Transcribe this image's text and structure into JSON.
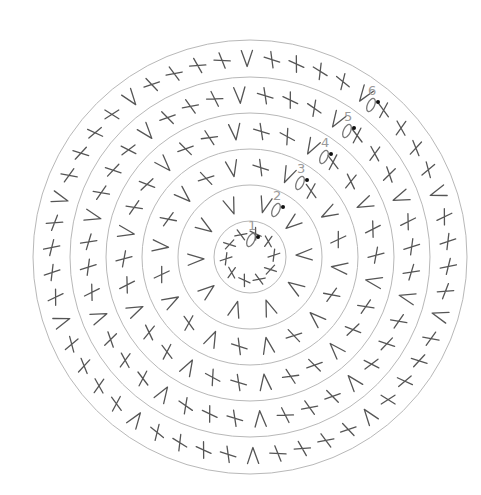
{
  "diagram": {
    "type": "crochet-round-chart",
    "center": [
      250,
      257
    ],
    "colors": {
      "ring_stroke": "#b8b8b8",
      "symbol_stroke": "#555555",
      "label": "#9a9a9a",
      "start_dot": "#111111"
    },
    "symbol_legend": {
      "X": "single-crochet-icon",
      "V": "increase-icon",
      "O": "chain-icon",
      "dot": "slip-stitch-icon"
    },
    "rings": [
      {
        "round": 1,
        "label": "1",
        "radius": 36,
        "pattern": [
          "X"
        ],
        "repeats": 10,
        "count": 10
      },
      {
        "round": 2,
        "label": "2",
        "radius": 72,
        "pattern": [
          "V"
        ],
        "repeats": 10,
        "count": 10
      },
      {
        "round": 3,
        "label": "3",
        "radius": 108,
        "pattern": [
          "X",
          "V"
        ],
        "repeats": 10,
        "count": 20
      },
      {
        "round": 4,
        "label": "4",
        "radius": 144,
        "pattern": [
          "X",
          "X",
          "V"
        ],
        "repeats": 10,
        "count": 30
      },
      {
        "round": 5,
        "label": "5",
        "radius": 180,
        "pattern": [
          "X",
          "X",
          "X",
          "V"
        ],
        "repeats": 10,
        "count": 40
      },
      {
        "round": 6,
        "label": "6",
        "radius": 217,
        "pattern": [
          "X",
          "X",
          "X",
          "X",
          "V"
        ],
        "repeats": 10,
        "count": 50
      }
    ],
    "start_markers": [
      {
        "round": "1",
        "x": 258,
        "y": 237
      },
      {
        "round": "2",
        "x": 283,
        "y": 207
      },
      {
        "round": "3",
        "x": 307,
        "y": 180
      },
      {
        "round": "4",
        "x": 331,
        "y": 154
      },
      {
        "round": "5",
        "x": 354,
        "y": 128
      },
      {
        "round": "6",
        "x": 378,
        "y": 102
      }
    ]
  }
}
